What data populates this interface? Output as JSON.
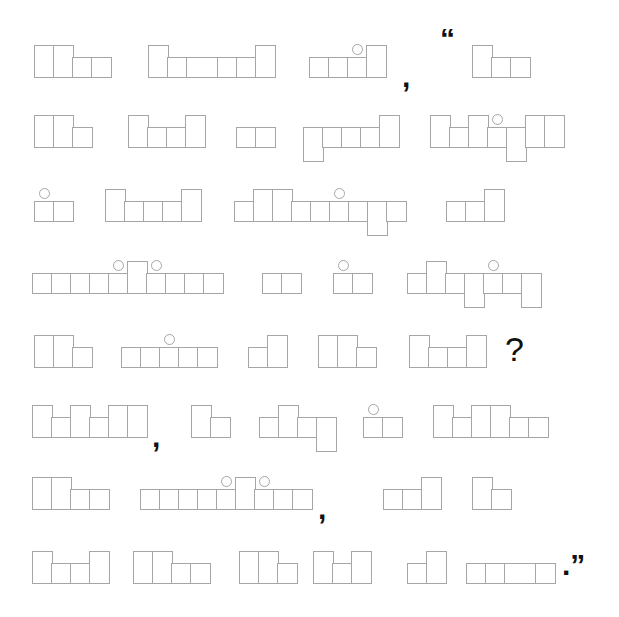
{
  "legend": {
    "x": "x-height letter box",
    "t": "tall letter box (ascender)",
    "d": "descender letter box",
    "i": "x-height letter box with dot above",
    "X": "wide x-height letter box",
    "T": "wide tall letter box"
  },
  "lines": [
    {
      "items": [
        {
          "type": "word",
          "shape": "ttxx"
        },
        {
          "type": "word",
          "shape": "txXxxt"
        },
        {
          "type": "word",
          "shape": "xxit"
        },
        {
          "type": "punct",
          "text": ","
        },
        {
          "type": "punct",
          "text": "“"
        },
        {
          "type": "word",
          "shape": "txx"
        }
      ]
    },
    {
      "items": [
        {
          "type": "word",
          "shape": "ttx"
        },
        {
          "type": "word",
          "shape": "txxt"
        },
        {
          "type": "word",
          "shape": "xx"
        },
        {
          "type": "word",
          "shape": "dxxxt"
        },
        {
          "type": "word",
          "shape": "txtidtt"
        }
      ]
    },
    {
      "items": [
        {
          "type": "word",
          "shape": "ix"
        },
        {
          "type": "word",
          "shape": "txxxt"
        },
        {
          "type": "word",
          "shape": "xttxxixdx"
        },
        {
          "type": "word",
          "shape": "xxt"
        }
      ]
    },
    {
      "items": [
        {
          "type": "word",
          "shape": "xxxxitixxx"
        },
        {
          "type": "word",
          "shape": "xx"
        },
        {
          "type": "word",
          "shape": "ix"
        },
        {
          "type": "word",
          "shape": "xtxdixd"
        }
      ]
    },
    {
      "items": [
        {
          "type": "word",
          "shape": "ttx"
        },
        {
          "type": "word",
          "shape": "xxixx"
        },
        {
          "type": "word",
          "shape": "xt"
        },
        {
          "type": "word",
          "shape": "ttx"
        },
        {
          "type": "word",
          "shape": "txxt"
        },
        {
          "type": "qmark",
          "text": "?"
        }
      ]
    },
    {
      "items": [
        {
          "type": "word",
          "shape": "txtxtt"
        },
        {
          "type": "punct",
          "text": ","
        },
        {
          "type": "word",
          "shape": "tx"
        },
        {
          "type": "word",
          "shape": "xtxd"
        },
        {
          "type": "word",
          "shape": "ix"
        },
        {
          "type": "word",
          "shape": "txttxx"
        }
      ]
    },
    {
      "items": [
        {
          "type": "word",
          "shape": "ttxx"
        },
        {
          "type": "word",
          "shape": "xxxxitixx"
        },
        {
          "type": "punct",
          "text": ","
        },
        {
          "type": "word",
          "shape": "xxt"
        },
        {
          "type": "word",
          "shape": "tx"
        }
      ]
    },
    {
      "items": [
        {
          "type": "word",
          "shape": "txxt"
        },
        {
          "type": "word",
          "shape": "ttxx"
        },
        {
          "type": "word",
          "shape": "ttx"
        },
        {
          "type": "word",
          "shape": "txt"
        },
        {
          "type": "word",
          "shape": "xt"
        },
        {
          "type": "word",
          "shape": "xxXx"
        },
        {
          "type": "punct",
          "text": ".”"
        }
      ]
    }
  ],
  "colors": {
    "box_stroke": "#a6a6a6",
    "punct": "#111111",
    "background": "#ffffff"
  }
}
